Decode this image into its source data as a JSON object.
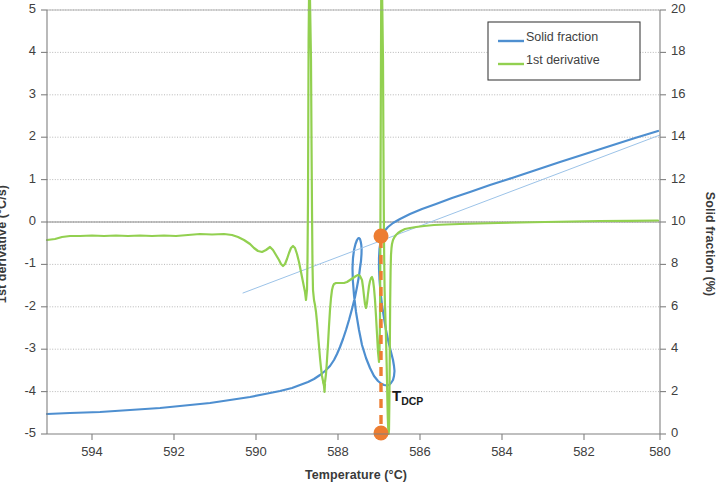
{
  "chart_data": {
    "type": "line",
    "title": "",
    "xlabel": "Temperature (°C)",
    "x_axis": {
      "label": "Temperature (°C)",
      "ticks": [
        594,
        592,
        590,
        588,
        586,
        584,
        582,
        580
      ],
      "xlim": [
        595.05,
        580
      ],
      "reversed": true
    },
    "y_axis_left": {
      "label": "1st derivative (°C/s)",
      "ticks": [
        5,
        4,
        3,
        2,
        1,
        0,
        -1,
        -2,
        -3,
        -4,
        -5
      ],
      "ylim": [
        -5,
        5
      ],
      "color": "#404040"
    },
    "y_axis_right": {
      "label": "Solid fraction (%)",
      "ticks": [
        20,
        18,
        16,
        14,
        12,
        10,
        8,
        6,
        4,
        2,
        0
      ],
      "ylim": [
        0,
        20
      ],
      "color": "#404040"
    },
    "grid": true,
    "legend": {
      "position": "top-right",
      "entries": [
        {
          "label": "Solid fraction",
          "color": "#4e8fd0",
          "axis": "right"
        },
        {
          "label": "1st derivative",
          "color": "#92d050",
          "axis": "left"
        }
      ]
    },
    "annotations": [
      {
        "name": "tdcp-label",
        "text": "T",
        "subscript": "DCP",
        "x": 586.6,
        "y_left": -4.1
      },
      {
        "name": "tdcp-marker-upper",
        "type": "point",
        "color": "#ed7d31",
        "x": 587.05,
        "y_left": -0.18,
        "y_right": 9.8
      },
      {
        "name": "tdcp-marker-lower",
        "type": "point",
        "color": "#ed7d31",
        "x": 587.05,
        "y_left": -5.0,
        "y_right": 0.0
      },
      {
        "name": "tdcp-dashed-line",
        "type": "vertical-dashed",
        "color": "#ed7d31",
        "x": 587.05,
        "y_from_left": -0.18,
        "y_to_left": -5.0
      }
    ],
    "series": [
      {
        "name": "Solid fraction",
        "color": "#4e8fd0",
        "axis": "right",
        "width": 2.2,
        "points_px": [
          [
            47,
            414
          ],
          [
            70,
            413
          ],
          [
            100,
            412
          ],
          [
            130,
            410
          ],
          [
            160,
            408
          ],
          [
            190,
            405
          ],
          [
            210,
            403
          ],
          [
            230,
            400
          ],
          [
            250,
            397
          ],
          [
            265,
            394
          ],
          [
            280,
            391
          ],
          [
            292,
            388
          ],
          [
            300,
            385
          ],
          [
            308,
            382
          ],
          [
            314,
            379
          ],
          [
            320,
            375
          ],
          [
            325,
            371
          ],
          [
            330,
            366
          ],
          [
            334,
            360
          ],
          [
            337,
            354
          ],
          [
            340,
            347
          ],
          [
            343,
            339
          ],
          [
            346,
            330
          ],
          [
            349,
            320
          ],
          [
            352,
            309
          ],
          [
            355,
            297
          ],
          [
            357,
            287
          ],
          [
            359,
            276
          ],
          [
            360,
            268
          ],
          [
            361,
            261
          ],
          [
            361.5,
            254
          ],
          [
            361.6,
            249
          ],
          [
            361.3,
            245
          ],
          [
            360.8,
            242
          ],
          [
            360,
            239
          ],
          [
            359,
            238
          ],
          [
            358,
            238.5
          ],
          [
            357,
            240
          ],
          [
            355.5,
            244
          ],
          [
            354,
            250
          ],
          [
            353,
            258
          ],
          [
            352.5,
            268
          ],
          [
            352.8,
            280
          ],
          [
            354,
            295
          ],
          [
            356,
            312
          ],
          [
            359,
            330
          ],
          [
            362,
            345
          ],
          [
            366,
            358
          ],
          [
            370,
            368
          ],
          [
            374,
            376
          ],
          [
            378,
            381
          ],
          [
            381,
            383.5
          ],
          [
            384,
            385
          ],
          [
            387,
            385.5
          ],
          [
            389,
            385
          ],
          [
            391,
            383
          ],
          [
            393,
            380
          ],
          [
            394,
            376
          ],
          [
            394.5,
            371
          ],
          [
            394,
            366
          ],
          [
            393,
            360
          ],
          [
            391,
            352
          ],
          [
            388.5,
            342
          ],
          [
            386,
            330
          ],
          [
            384,
            318
          ],
          [
            382,
            305
          ],
          [
            380.5,
            292
          ],
          [
            379.5,
            280
          ],
          [
            379,
            268
          ],
          [
            379,
            258
          ],
          [
            379.5,
            249
          ],
          [
            380.5,
            242
          ],
          [
            382,
            236
          ],
          [
            384.5,
            231
          ],
          [
            388,
            227
          ],
          [
            393,
            223
          ],
          [
            400,
            219
          ],
          [
            410,
            214
          ],
          [
            422,
            209
          ],
          [
            436,
            204
          ],
          [
            452,
            198
          ],
          [
            470,
            192
          ],
          [
            490,
            185
          ],
          [
            512,
            178
          ],
          [
            536,
            170
          ],
          [
            560,
            162
          ],
          [
            585,
            154
          ],
          [
            610,
            146
          ],
          [
            635,
            138
          ],
          [
            658,
            131
          ]
        ]
      },
      {
        "name": "Solid fraction baseline",
        "color": "#9cc3e8",
        "axis": "right",
        "width": 1.0,
        "points_px": [
          [
            243,
            293
          ],
          [
            660,
            135
          ]
        ]
      },
      {
        "name": "1st derivative",
        "color": "#92d050",
        "axis": "left",
        "width": 2.2,
        "points_px": [
          [
            47,
            240
          ],
          [
            55,
            239
          ],
          [
            62,
            237
          ],
          [
            70,
            236
          ],
          [
            80,
            236
          ],
          [
            92,
            235.5
          ],
          [
            104,
            236
          ],
          [
            116,
            235.5
          ],
          [
            128,
            236
          ],
          [
            140,
            235.5
          ],
          [
            152,
            236
          ],
          [
            164,
            235.5
          ],
          [
            176,
            236
          ],
          [
            188,
            235
          ],
          [
            200,
            234
          ],
          [
            212,
            234.5
          ],
          [
            224,
            234
          ],
          [
            232,
            235
          ],
          [
            238,
            237
          ],
          [
            244,
            240
          ],
          [
            250,
            244
          ],
          [
            254,
            248
          ],
          [
            258,
            251
          ],
          [
            262,
            252
          ],
          [
            266,
            250
          ],
          [
            270,
            247
          ],
          [
            273,
            250
          ],
          [
            276,
            255
          ],
          [
            279,
            260
          ],
          [
            281,
            264
          ],
          [
            283,
            266
          ],
          [
            285,
            264
          ],
          [
            287,
            259
          ],
          [
            289,
            253
          ],
          [
            291,
            248
          ],
          [
            293,
            246
          ],
          [
            295,
            248
          ],
          [
            297,
            254
          ],
          [
            299,
            262
          ],
          [
            301,
            272
          ],
          [
            303,
            282
          ],
          [
            305,
            292
          ],
          [
            306,
            300
          ],
          [
            307,
            290
          ],
          [
            307.5,
            260
          ],
          [
            308,
            200
          ],
          [
            308.3,
            120
          ],
          [
            308.6,
            40
          ],
          [
            309,
            0
          ],
          [
            310,
            0
          ],
          [
            311,
            60
          ],
          [
            311.5,
            140
          ],
          [
            312,
            210
          ],
          [
            312.5,
            265
          ],
          [
            313,
            290
          ],
          [
            314,
            300
          ],
          [
            315,
            305
          ],
          [
            316,
            312
          ],
          [
            317,
            322
          ],
          [
            318,
            334
          ],
          [
            319,
            346
          ],
          [
            320,
            358
          ],
          [
            321,
            368
          ],
          [
            322,
            376
          ],
          [
            323,
            381
          ],
          [
            324,
            384
          ],
          [
            325,
            382
          ],
          [
            326,
            374
          ],
          [
            327,
            360
          ],
          [
            328,
            344
          ],
          [
            329,
            326
          ],
          [
            330,
            310
          ],
          [
            331,
            298
          ],
          [
            332,
            290
          ],
          [
            333,
            286
          ],
          [
            334,
            284
          ],
          [
            336,
            283
          ],
          [
            338,
            283
          ],
          [
            341,
            283
          ],
          [
            344,
            283
          ],
          [
            347,
            282
          ],
          [
            350,
            280
          ],
          [
            353,
            278
          ],
          [
            356,
            276
          ],
          [
            358,
            275
          ],
          [
            360,
            276
          ],
          [
            362,
            280
          ],
          [
            363,
            287
          ],
          [
            364,
            296
          ],
          [
            365,
            304
          ],
          [
            366,
            308
          ],
          [
            367,
            303
          ],
          [
            368,
            294
          ],
          [
            369,
            286
          ],
          [
            370,
            281
          ],
          [
            371,
            278
          ],
          [
            372,
            277
          ],
          [
            373,
            280
          ],
          [
            374,
            288
          ],
          [
            375,
            300
          ],
          [
            376,
            316
          ],
          [
            377,
            334
          ],
          [
            378,
            352
          ],
          [
            379,
            362
          ],
          [
            379.5,
            350
          ],
          [
            380,
            320
          ],
          [
            380.3,
            260
          ],
          [
            380.6,
            170
          ],
          [
            380.9,
            80
          ],
          [
            381.2,
            0
          ],
          [
            382.2,
            0
          ],
          [
            383,
            60
          ],
          [
            383.4,
            140
          ],
          [
            383.8,
            210
          ],
          [
            384.2,
            260
          ],
          [
            384.6,
            290
          ],
          [
            385,
            305
          ],
          [
            385.4,
            318
          ],
          [
            385.8,
            330
          ],
          [
            386.2,
            345
          ],
          [
            386.6,
            362
          ],
          [
            387,
            380
          ],
          [
            387.4,
            400
          ],
          [
            387.8,
            418
          ],
          [
            388.2,
            428
          ],
          [
            388.6,
            434
          ],
          [
            389,
            430
          ],
          [
            389.4,
            400
          ],
          [
            389.8,
            350
          ],
          [
            390.2,
            300
          ],
          [
            390.6,
            270
          ],
          [
            391,
            255
          ],
          [
            391.5,
            248
          ],
          [
            392,
            244
          ],
          [
            393,
            240
          ],
          [
            394.5,
            237
          ],
          [
            396,
            235
          ],
          [
            398,
            233
          ],
          [
            401,
            231
          ],
          [
            405,
            229
          ],
          [
            410,
            228
          ],
          [
            416,
            227
          ],
          [
            424,
            226
          ],
          [
            434,
            225
          ],
          [
            446,
            224.5
          ],
          [
            460,
            224
          ],
          [
            478,
            223.5
          ],
          [
            498,
            223
          ],
          [
            520,
            222.5
          ],
          [
            545,
            222
          ],
          [
            572,
            221.5
          ],
          [
            600,
            221
          ],
          [
            630,
            220.8
          ],
          [
            658,
            220.5
          ]
        ]
      },
      {
        "name": "1st derivative spike trough",
        "color": "#92d050",
        "axis": "left",
        "width": 2.2,
        "points_px": [
          [
            323,
            381
          ],
          [
            324,
            386
          ],
          [
            324.5,
            392
          ],
          [
            325,
            384
          ]
        ]
      }
    ]
  },
  "legend": {
    "solid_fraction_label": "Solid fraction",
    "first_derivative_label": "1st derivative"
  },
  "axes": {
    "x_title": "Temperature (°C)",
    "y_left_title": "1st derivative (°C/s)",
    "y_right_title": "Solid fraction (%)",
    "x_ticks": [
      "594",
      "592",
      "590",
      "588",
      "586",
      "584",
      "582",
      "580"
    ],
    "y_left_ticks": [
      "5",
      "4",
      "3",
      "2",
      "1",
      "0",
      "-1",
      "-2",
      "-3",
      "-4",
      "-5"
    ],
    "y_right_ticks": [
      "20",
      "18",
      "16",
      "14",
      "12",
      "10",
      "8",
      "6",
      "4",
      "2",
      "0"
    ]
  },
  "annotation": {
    "tdcp_main": "T",
    "tdcp_sub": "DCP"
  },
  "colors": {
    "solid_fraction": "#4e8fd0",
    "first_derivative": "#92d050",
    "marker": "#ed7d31",
    "grid": "#808080",
    "axis": "#808080"
  }
}
